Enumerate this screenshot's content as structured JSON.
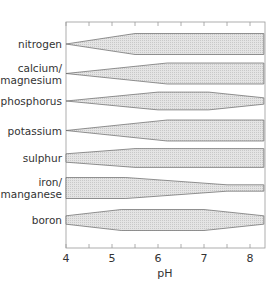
{
  "chart_data": {
    "type": "area",
    "title": "",
    "xlabel": "pH",
    "ylabel": "",
    "xlim": [
      4,
      8.3
    ],
    "x_ticks": [
      4,
      5,
      6,
      7,
      8
    ],
    "minor_ticks": [
      4.5,
      5.5,
      6.5,
      7.5
    ],
    "grid": false,
    "legend": null,
    "series": [
      {
        "name": "nitrogen",
        "label_lines": [
          "nitrogen"
        ],
        "center": 44,
        "profile": [
          {
            "ph": 4.0,
            "width": 0.0
          },
          {
            "ph": 5.5,
            "width": 1.0
          },
          {
            "ph": 8.3,
            "width": 1.0
          }
        ]
      },
      {
        "name": "calcium/magnesium",
        "label_lines": [
          "calcium/",
          "magnesium"
        ],
        "center": 73.5,
        "profile": [
          {
            "ph": 4.0,
            "width": 0.0
          },
          {
            "ph": 6.2,
            "width": 1.0
          },
          {
            "ph": 8.3,
            "width": 1.0
          }
        ]
      },
      {
        "name": "phosphorus",
        "label_lines": [
          "phosphorus"
        ],
        "center": 101,
        "profile": [
          {
            "ph": 4.0,
            "width": 0.0
          },
          {
            "ph": 6.0,
            "width": 0.85
          },
          {
            "ph": 7.1,
            "width": 0.85
          },
          {
            "ph": 8.3,
            "width": 0.3
          }
        ]
      },
      {
        "name": "potassium",
        "label_lines": [
          "potassium"
        ],
        "center": 130.5,
        "profile": [
          {
            "ph": 4.0,
            "width": 0.0
          },
          {
            "ph": 6.2,
            "width": 1.0
          },
          {
            "ph": 8.3,
            "width": 1.0
          }
        ]
      },
      {
        "name": "sulphur",
        "label_lines": [
          "sulphur"
        ],
        "center": 158,
        "profile": [
          {
            "ph": 4.0,
            "width": 0.4
          },
          {
            "ph": 5.5,
            "width": 0.9
          },
          {
            "ph": 8.3,
            "width": 0.9
          }
        ]
      },
      {
        "name": "iron/manganese",
        "label_lines": [
          "iron/",
          "manganese"
        ],
        "center": 188,
        "profile": [
          {
            "ph": 4.0,
            "width": 1.0
          },
          {
            "ph": 5.3,
            "width": 1.0
          },
          {
            "ph": 7.5,
            "width": 0.3
          },
          {
            "ph": 8.3,
            "width": 0.3
          }
        ]
      },
      {
        "name": "boron",
        "label_lines": [
          "boron"
        ],
        "center": 220,
        "profile": [
          {
            "ph": 4.0,
            "width": 0.4
          },
          {
            "ph": 5.2,
            "width": 1.0
          },
          {
            "ph": 7.0,
            "width": 1.0
          },
          {
            "ph": 8.3,
            "width": 0.4
          }
        ]
      }
    ]
  },
  "axis": {
    "xlabel": "pH",
    "tick_labels": [
      "4",
      "5",
      "6",
      "7",
      "8"
    ]
  },
  "labels": {
    "nitrogen": [
      "nitrogen"
    ],
    "calcium": [
      "calcium/",
      "magnesium"
    ],
    "phosphorus": [
      "phosphorus"
    ],
    "potassium": [
      "potassium"
    ],
    "sulphur": [
      "sulphur"
    ],
    "iron": [
      "iron/",
      "manganese"
    ],
    "boron": [
      "boron"
    ]
  },
  "colors": {
    "band_fill": "#d9d9d9",
    "band_stroke": "#666666",
    "axis": "#888888",
    "text": "#333333"
  }
}
